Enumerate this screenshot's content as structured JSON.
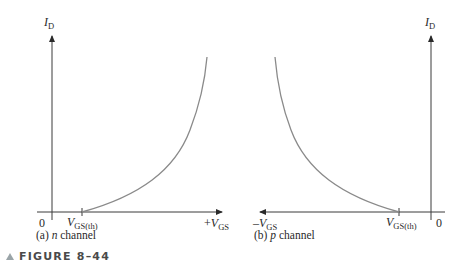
{
  "figure": {
    "label": "FIGURE 8–44",
    "triangle_icon": "triangle-marker"
  },
  "panels": [
    {
      "id": "a",
      "caption_prefix": "(a) ",
      "caption_italic": "n",
      "caption_suffix": " channel",
      "y_axis_label": "I",
      "y_axis_sub": "D",
      "origin_label": "0",
      "threshold_label": "V",
      "threshold_sub": "GS(th)",
      "x_axis_label_prefix": "+",
      "x_axis_label": "V",
      "x_axis_sub": "GS"
    },
    {
      "id": "b",
      "caption_prefix": "(b) ",
      "caption_italic": "p",
      "caption_suffix": " channel",
      "y_axis_label": "I",
      "y_axis_sub": "D",
      "origin_label": "0",
      "threshold_label": "V",
      "threshold_sub": "GS(th)",
      "x_axis_label_prefix": "–",
      "x_axis_label": "V",
      "x_axis_sub": "GS"
    }
  ],
  "colors": {
    "axis": "#3a3a3a",
    "curve": "#8a8a8a",
    "text": "#2a2a2a"
  }
}
